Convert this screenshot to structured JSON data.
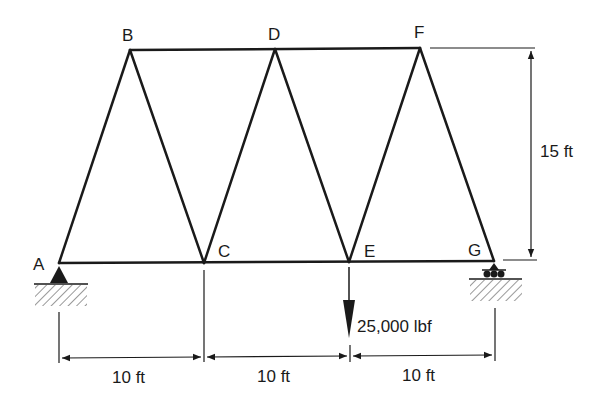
{
  "diagram": {
    "type": "truss",
    "nodes": {
      "A": {
        "label": "A"
      },
      "B": {
        "label": "B"
      },
      "C": {
        "label": "C"
      },
      "D": {
        "label": "D"
      },
      "E": {
        "label": "E"
      },
      "F": {
        "label": "F"
      },
      "G": {
        "label": "G"
      }
    },
    "members": [
      "AB",
      "BC",
      "CD",
      "DE",
      "EF",
      "FG",
      "BD",
      "DF",
      "AC",
      "CE",
      "EG"
    ],
    "supports": {
      "A": "pin",
      "G": "roller"
    },
    "load": {
      "node": "E",
      "label": "25,000 lbf",
      "direction": "down"
    },
    "dimensions": {
      "span1": "10 ft",
      "span2": "10 ft",
      "span3": "10 ft",
      "height": "15 ft"
    },
    "colors": {
      "line": "#1a1a1a",
      "background": "#ffffff"
    }
  }
}
